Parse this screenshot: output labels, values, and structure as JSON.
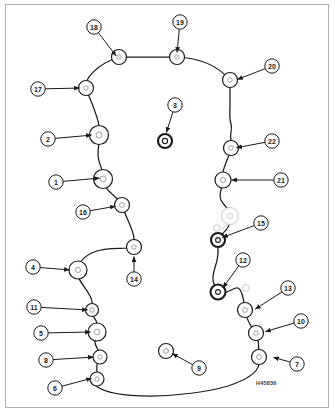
{
  "sheet": {
    "title": "Cylinder head gasket bolt-hole location diagram",
    "part_number_label": "H45836",
    "background_color": "#ffffff",
    "frame_color": "#b0b0b0",
    "line_color": "#1a1a1a",
    "ghost_color": "#c9c9c9"
  },
  "diagram": {
    "type": "exploded-parts-callout",
    "outline_name": "gasket-outline"
  },
  "callouts": [
    {
      "id": "1",
      "label": "1",
      "bx": 56,
      "by": 182,
      "tx": 101,
      "ty": 178,
      "arrow": true,
      "target": "hole-1"
    },
    {
      "id": "2",
      "label": "2",
      "bx": 48,
      "by": 139,
      "tx": 93,
      "ty": 135,
      "arrow": true,
      "target": "hole-2"
    },
    {
      "id": "3",
      "label": "3",
      "bx": 175,
      "by": 105,
      "tx": 166,
      "ty": 134,
      "arrow": true,
      "target": "hole-3"
    },
    {
      "id": "4",
      "label": "4",
      "bx": 33,
      "by": 267,
      "tx": 71,
      "ty": 270,
      "arrow": true,
      "target": "hole-4"
    },
    {
      "id": "5",
      "label": "5",
      "bx": 41,
      "by": 333,
      "tx": 92,
      "ty": 332,
      "arrow": true,
      "target": "hole-5"
    },
    {
      "id": "6",
      "label": "6",
      "bx": 55,
      "by": 388,
      "tx": 93,
      "ty": 378,
      "arrow": true,
      "target": "hole-6"
    },
    {
      "id": "7",
      "label": "7",
      "bx": 297,
      "by": 364,
      "tx": 272,
      "ty": 357,
      "arrow": true,
      "target": "hole-7"
    },
    {
      "id": "8",
      "label": "8",
      "bx": 46,
      "by": 360,
      "tx": 95,
      "ty": 357,
      "arrow": true,
      "target": "hole-8"
    },
    {
      "id": "9",
      "label": "9",
      "bx": 199,
      "by": 368,
      "tx": 171,
      "ty": 353,
      "arrow": true,
      "target": "hole-9"
    },
    {
      "id": "10",
      "label": "10",
      "bx": 301,
      "by": 321,
      "tx": 264,
      "ty": 332,
      "arrow": true,
      "target": "hole-10"
    },
    {
      "id": "11",
      "label": "11",
      "bx": 34,
      "by": 307,
      "tx": 89,
      "ty": 310,
      "arrow": true,
      "target": "hole-11"
    },
    {
      "id": "12",
      "label": "12",
      "bx": 243,
      "by": 260,
      "tx": 222,
      "ty": 289,
      "arrow": true,
      "target": "hole-12"
    },
    {
      "id": "13",
      "label": "13",
      "bx": 288,
      "by": 288,
      "tx": 254,
      "ty": 310,
      "arrow": true,
      "target": "hole-13"
    },
    {
      "id": "14",
      "label": "14",
      "bx": 134,
      "by": 279,
      "tx": 134,
      "ty": 255,
      "arrow": true,
      "target": "hole-14"
    },
    {
      "id": "15",
      "label": "15",
      "bx": 261,
      "by": 223,
      "tx": 221,
      "ty": 238,
      "arrow": true,
      "target": "hole-15"
    },
    {
      "id": "16",
      "label": "16",
      "bx": 83,
      "by": 212,
      "tx": 117,
      "ty": 206,
      "arrow": true,
      "target": "hole-16"
    },
    {
      "id": "17",
      "label": "17",
      "bx": 38,
      "by": 89,
      "tx": 81,
      "ty": 88,
      "arrow": true,
      "target": "hole-17"
    },
    {
      "id": "18",
      "label": "18",
      "bx": 94,
      "by": 27,
      "tx": 117,
      "ty": 57,
      "arrow": true,
      "target": "hole-18"
    },
    {
      "id": "19",
      "label": "19",
      "bx": 180,
      "by": 22,
      "tx": 177,
      "ty": 54,
      "arrow": true,
      "target": "hole-19"
    },
    {
      "id": "20",
      "label": "20",
      "bx": 272,
      "by": 66,
      "tx": 236,
      "ty": 80,
      "arrow": true,
      "target": "hole-20"
    },
    {
      "id": "21",
      "label": "21",
      "bx": 281,
      "by": 180,
      "tx": 230,
      "ty": 180,
      "arrow": true,
      "target": "hole-21"
    },
    {
      "id": "22",
      "label": "22",
      "bx": 272,
      "by": 141,
      "tx": 235,
      "ty": 148,
      "arrow": true,
      "target": "hole-22"
    }
  ],
  "holes": [
    {
      "name": "hole-18",
      "cx": 119,
      "cy": 57,
      "r_outer": 7.5,
      "r_inner": 2.2,
      "style": "normal"
    },
    {
      "name": "hole-19",
      "cx": 177,
      "cy": 57,
      "r_outer": 7.5,
      "r_inner": 2.2,
      "style": "normal"
    },
    {
      "name": "hole-20",
      "cx": 230,
      "cy": 80,
      "r_outer": 7.5,
      "r_inner": 2.2,
      "style": "normal"
    },
    {
      "name": "hole-17",
      "cx": 86,
      "cy": 88,
      "r_outer": 7.5,
      "r_inner": 2.2,
      "style": "normal"
    },
    {
      "name": "hole-2",
      "cx": 99,
      "cy": 135,
      "r_outer": 9.5,
      "r_inner": 3.0,
      "style": "normal"
    },
    {
      "name": "hole-22",
      "cx": 231,
      "cy": 148,
      "r_outer": 7.5,
      "r_inner": 2.2,
      "style": "normal"
    },
    {
      "name": "hole-3",
      "cx": 165,
      "cy": 141,
      "r_outer": 7.0,
      "r_inner": 2.6,
      "style": "bold"
    },
    {
      "name": "hole-1",
      "cx": 103,
      "cy": 179,
      "r_outer": 9.5,
      "r_inner": 3.0,
      "style": "normal"
    },
    {
      "name": "hole-21",
      "cx": 223,
      "cy": 180,
      "r_outer": 8.0,
      "r_inner": 2.6,
      "style": "normal"
    },
    {
      "name": "hole-16",
      "cx": 122,
      "cy": 205,
      "r_outer": 7.5,
      "r_inner": 2.4,
      "style": "normal"
    },
    {
      "name": "hole-ghost-a",
      "cx": 230,
      "cy": 216,
      "r_outer": 8.5,
      "r_inner": 2.6,
      "style": "ghost"
    },
    {
      "name": "hole-ghost-b",
      "cx": 217,
      "cy": 228,
      "r_outer": 3.2,
      "r_inner": 0.0,
      "style": "ghost"
    },
    {
      "name": "hole-15",
      "cx": 218,
      "cy": 240,
      "r_outer": 7.0,
      "r_inner": 2.4,
      "style": "bold"
    },
    {
      "name": "hole-14",
      "cx": 134,
      "cy": 247,
      "r_outer": 7.5,
      "r_inner": 2.2,
      "style": "normal"
    },
    {
      "name": "hole-4",
      "cx": 78,
      "cy": 270,
      "r_outer": 9.0,
      "r_inner": 2.6,
      "style": "normal"
    },
    {
      "name": "hole-12",
      "cx": 218,
      "cy": 292,
      "r_outer": 7.5,
      "r_inner": 2.4,
      "style": "bold"
    },
    {
      "name": "hole-ghost-c",
      "cx": 246,
      "cy": 288,
      "r_outer": 3.4,
      "r_inner": 0.0,
      "style": "ghost"
    },
    {
      "name": "hole-11",
      "cx": 92,
      "cy": 310,
      "r_outer": 6.5,
      "r_inner": 2.2,
      "style": "normal"
    },
    {
      "name": "hole-13",
      "cx": 245,
      "cy": 310,
      "r_outer": 7.5,
      "r_inner": 2.4,
      "style": "normal"
    },
    {
      "name": "hole-5",
      "cx": 97,
      "cy": 332,
      "r_outer": 9.0,
      "r_inner": 2.8,
      "style": "normal"
    },
    {
      "name": "hole-10",
      "cx": 256,
      "cy": 333,
      "r_outer": 7.5,
      "r_inner": 2.2,
      "style": "normal"
    },
    {
      "name": "hole-9",
      "cx": 166,
      "cy": 351,
      "r_outer": 7.5,
      "r_inner": 2.4,
      "style": "normal"
    },
    {
      "name": "hole-8",
      "cx": 100,
      "cy": 357,
      "r_outer": 7.0,
      "r_inner": 2.2,
      "style": "normal"
    },
    {
      "name": "hole-7",
      "cx": 259,
      "cy": 357,
      "r_outer": 7.5,
      "r_inner": 2.4,
      "style": "normal"
    },
    {
      "name": "hole-6",
      "cx": 97,
      "cy": 379,
      "r_outer": 7.0,
      "r_inner": 2.2,
      "style": "normal"
    }
  ],
  "outline_path": "M 119 57 L 177 57 C 200 58 218 66 230 80 L 230 104 C 230 112 229 118 231 124 C 233 130 229 134 231 140 L 231 148 C 230 156 225 162 223 172 L 223 180 C 222 190 218 194 221 200 C 224 206 228 208 230 212 L 230 222 C 229 230 222 232 218 240 L 218 252 C 218 262 214 268 213 276 C 212 284 216 288 218 292 C 223 296 230 290 236 288 C 242 286 244 302 245 310 C 246 320 252 328 256 333 C 260 340 258 350 259 357 L 259 364 C 258 372 246 380 228 386 C 208 392 176 396 150 396 C 122 396 104 392 96 386 C 90 382 92 382 97 379 L 97 372 C 96 364 98 360 100 357 C 102 352 94 348 95 340 C 96 336 97 334 97 332 L 97 324 C 97 318 90 316 92 310 L 92 302 C 92 294 80 284 78 276 C 77 272 78 271 78 270 C 79 262 84 256 94 252 C 108 246 126 250 134 247 L 134 238 C 133 228 125 216 122 205 C 120 198 102 190 103 179 C 104 170 98 164 98 154 C 98 146 100 140 99 135 L 99 126 C 98 116 90 100 86 88 C 84 78 98 64 119 57 Z",
  "ghost_arc": "M 222 230 C 224 226 228 224 230 222"
}
